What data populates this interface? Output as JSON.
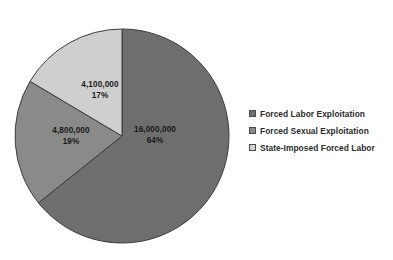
{
  "chart_data": {
    "type": "pie",
    "title": "",
    "subtitle": "",
    "xlabel": "",
    "ylabel": "",
    "grid": false,
    "legend_position": "right",
    "start_angle_deg": 0,
    "direction": "clockwise",
    "categories": [
      "Forced Labor Exploitation",
      "Forced Sexual Exploitation",
      "State-Imposed Forced Labor"
    ],
    "values": [
      16000000,
      4800000,
      4100000
    ],
    "percentages": [
      64,
      19,
      17
    ],
    "value_labels": [
      "16,000,000",
      "4,800,000",
      "4,100,000"
    ],
    "percent_labels": [
      "64%",
      "19%",
      "17%"
    ],
    "colors": [
      "#6e6e6e",
      "#8a8a8a",
      "#cfcfcf"
    ],
    "slice_border_color": "#3d3d3d",
    "slices": [
      {
        "name": "Forced Labor Exploitation",
        "value": 16000000,
        "value_label": "16,000,000",
        "percent": 64,
        "percent_label": "64%",
        "color": "#6e6e6e"
      },
      {
        "name": "Forced Sexual Exploitation",
        "value": 4800000,
        "value_label": "4,800,000",
        "percent": 19,
        "percent_label": "19%",
        "color": "#8a8a8a"
      },
      {
        "name": "State-Imposed Forced Labor",
        "value": 4100000,
        "value_label": "4,100,000",
        "percent": 17,
        "percent_label": "17%",
        "color": "#cfcfcf"
      }
    ]
  },
  "legend": {
    "items": [
      {
        "label": "Forced Labor Exploitation",
        "color": "#6e6e6e",
        "marker": "square-swatch-icon"
      },
      {
        "label": "Forced Sexual Exploitation",
        "color": "#8a8a8a",
        "marker": "square-swatch-icon"
      },
      {
        "label": "State-Imposed Forced Labor",
        "color": "#cfcfcf",
        "marker": "square-swatch-icon"
      }
    ]
  },
  "labels": {
    "slice_1": {
      "value": "16,000,000",
      "percent": "64%"
    },
    "slice_2": {
      "value": "4,800,000",
      "percent": "19%"
    },
    "slice_3": {
      "value": "4,100,000",
      "percent": "17%"
    }
  }
}
